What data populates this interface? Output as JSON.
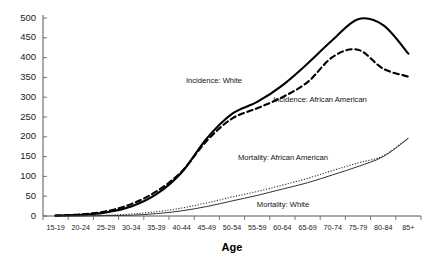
{
  "chart_data": {
    "type": "line",
    "title": "",
    "xlabel": "Age",
    "ylabel": "",
    "categories": [
      "15-19",
      "20-24",
      "25-29",
      "30-34",
      "35-39",
      "40-44",
      "45-49",
      "50-54",
      "55-59",
      "60-64",
      "65-69",
      "70-74",
      "75-79",
      "80-84",
      "85+"
    ],
    "ylim": [
      0,
      500
    ],
    "yticks": [
      0,
      50,
      100,
      150,
      200,
      250,
      300,
      350,
      400,
      450,
      500
    ],
    "grid": false,
    "legend_position": "inline-annotations",
    "series": [
      {
        "name": "Incidence: White",
        "style": "solid-thick",
        "label": "Incidence: White",
        "values": [
          1,
          3,
          9,
          24,
          55,
          110,
          196,
          258,
          288,
          330,
          385,
          445,
          497,
          482,
          410
        ]
      },
      {
        "name": "Incidence: African American",
        "style": "dashed-thick",
        "label": "Incidence: African American",
        "values": [
          1,
          4,
          12,
          30,
          62,
          112,
          190,
          246,
          272,
          300,
          338,
          402,
          420,
          372,
          352
        ]
      },
      {
        "name": "Mortality: African American",
        "style": "dotted-thin",
        "label": "Mortality: African American",
        "values": [
          0,
          1,
          2,
          5,
          11,
          20,
          33,
          48,
          62,
          78,
          95,
          115,
          134,
          152,
          197
        ]
      },
      {
        "name": "Mortality: White",
        "style": "solid-thin",
        "label": "Mortality: White",
        "values": [
          0,
          0,
          1,
          2,
          6,
          13,
          24,
          38,
          52,
          68,
          84,
          104,
          125,
          150,
          196
        ]
      }
    ],
    "annotations": [
      {
        "text": "Incidence: White",
        "x_category": "40-44",
        "y_value": 350
      },
      {
        "text": "Incidence: African American",
        "x_category": "60-64",
        "y_value": 305
      },
      {
        "text": "Mortality: African American",
        "x_category": "62",
        "y_value": 168
      },
      {
        "text": "Mortality: White",
        "x_category": "62",
        "y_value": 58
      }
    ],
    "colors": {
      "incidence_white": "#000000",
      "incidence_african_american": "#000000",
      "mortality_african_american": "#333333",
      "mortality_white": "#333333",
      "axis": "#555555",
      "background": "#ffffff"
    }
  }
}
